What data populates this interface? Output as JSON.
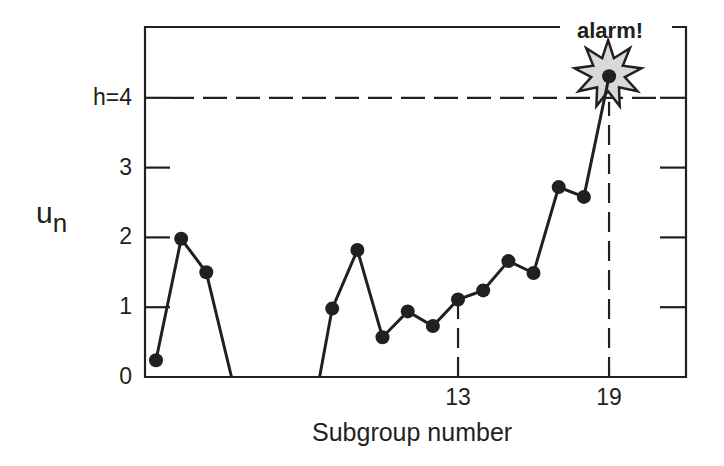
{
  "chart_data": {
    "type": "line",
    "title": "",
    "xlabel": "Subgroup number",
    "ylabel": "u_n",
    "ylabel_main": "u",
    "ylabel_sub": "n",
    "ylim": [
      0,
      5
    ],
    "xlim": [
      0.6,
      22.1
    ],
    "y_ticks": [
      {
        "value": 0,
        "label": "0"
      },
      {
        "value": 1,
        "label": "1"
      },
      {
        "value": 2,
        "label": "2"
      },
      {
        "value": 3,
        "label": "3"
      },
      {
        "value": 4,
        "label": "h=4"
      }
    ],
    "x_ticks": [
      {
        "value": 13,
        "label": "13"
      },
      {
        "value": 19,
        "label": "19"
      }
    ],
    "grid": false,
    "threshold": {
      "name": "h",
      "value": 4,
      "label": "h=4",
      "style": "dashed"
    },
    "segments": [
      [
        {
          "x": 1,
          "y": 0.24,
          "marker": true
        },
        {
          "x": 2,
          "y": 1.98,
          "marker": true
        },
        {
          "x": 3,
          "y": 1.5,
          "marker": true
        },
        {
          "x": 4.0,
          "y": 0,
          "marker": false
        }
      ],
      [
        {
          "x": 7.5,
          "y": 0,
          "marker": false
        },
        {
          "x": 8,
          "y": 0.98,
          "marker": true
        },
        {
          "x": 9,
          "y": 1.82,
          "marker": true
        },
        {
          "x": 10,
          "y": 0.57,
          "marker": true
        },
        {
          "x": 11,
          "y": 0.94,
          "marker": true
        },
        {
          "x": 12,
          "y": 0.73,
          "marker": true
        },
        {
          "x": 13,
          "y": 1.11,
          "marker": true
        },
        {
          "x": 14,
          "y": 1.24,
          "marker": true
        },
        {
          "x": 15,
          "y": 1.66,
          "marker": true
        },
        {
          "x": 16,
          "y": 1.49,
          "marker": true
        },
        {
          "x": 17,
          "y": 2.72,
          "marker": true
        },
        {
          "x": 18,
          "y": 2.58,
          "marker": true
        },
        {
          "x": 19,
          "y": 4.31,
          "marker": true
        }
      ]
    ],
    "series": [
      {
        "name": "u_n",
        "x": [
          1,
          2,
          3,
          8,
          9,
          10,
          11,
          12,
          13,
          14,
          15,
          16,
          17,
          18,
          19
        ],
        "values": [
          0.24,
          1.98,
          1.5,
          0.98,
          1.82,
          0.57,
          0.94,
          0.73,
          1.11,
          1.24,
          1.66,
          1.49,
          2.72,
          2.58,
          4.31
        ]
      }
    ],
    "vertical_markers": [
      {
        "x": 13,
        "style": "dashed",
        "from_y": 0,
        "to_y": 1.11
      },
      {
        "x": 19,
        "style": "dashed",
        "from_y": 0,
        "to_y": 4.31
      }
    ],
    "annotations": [
      {
        "text": "alarm!",
        "x": 19,
        "y": 4.31,
        "shape": "starburst"
      }
    ],
    "colors": {
      "ink": "#231f20",
      "star_fill": "#d9d9d9"
    }
  }
}
